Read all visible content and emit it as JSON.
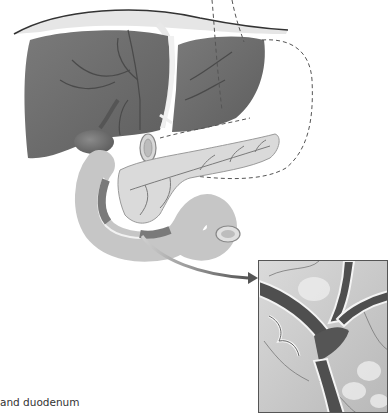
{
  "figure": {
    "caption_partial": "and duodenum",
    "labels": {
      "liver": "liver",
      "gallbladder": "gallbladder",
      "pancreas": "pancreas",
      "duodenum": "duodenum",
      "diaphragm": "diaphragm",
      "stomach_outline": "stomach outline (dashed)",
      "inset": "magnified detail of pancreatic/bile duct at ampulla",
      "arrow": "pointer arrow to inset"
    },
    "colors": {
      "liver": "#6e6e6e",
      "liver_vessels": "#4a4a4a",
      "diaphragm": "#e3e3e3",
      "diaphragm_edge": "#333333",
      "pancreas": "#d9d9d9",
      "pancreas_vessels": "#7a7a7a",
      "duodenum": "#c8c8c8",
      "duct_dark": "#4f4f4f",
      "dashed": "#555555",
      "inset_bg": "#cfcfcf"
    }
  }
}
